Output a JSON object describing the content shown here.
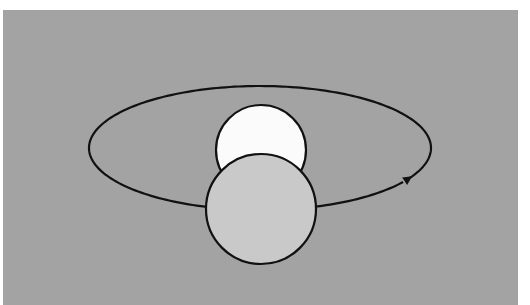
{
  "diagram": {
    "title": "",
    "canvas": {
      "width": 530,
      "height": 305,
      "page_bg": "#ffffff"
    },
    "panel": {
      "x": 3,
      "y": 10,
      "width": 515,
      "height": 295,
      "fill": "#a3a3a3"
    },
    "orbit": {
      "cx": 260,
      "cy": 148,
      "rx": 171,
      "ry": 62,
      "stroke": "#111111",
      "stroke_width": 2.2
    },
    "back_body": {
      "name": "white circle (behind)",
      "cx": 261,
      "cy": 150,
      "r": 45,
      "fill": "#fbfbfb",
      "stroke": "#111111"
    },
    "front_body": {
      "name": "light gray circle (front)",
      "cx": 261,
      "cy": 209,
      "r": 55,
      "fill": "#c9c9c9",
      "stroke": "#111111"
    },
    "direction_arrow": {
      "x": 368,
      "y": 200,
      "direction": "counterclockwise (moving right along near side)"
    }
  }
}
